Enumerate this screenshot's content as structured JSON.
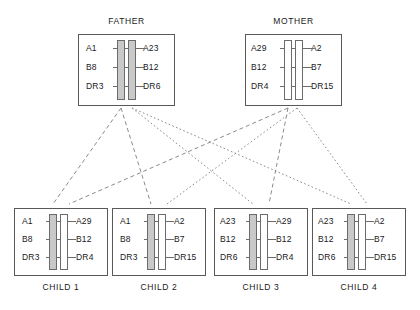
{
  "diagram": {
    "type": "hla-haplotype-inheritance-pedigree",
    "parents": [
      {
        "id": "father",
        "title": "FATHER",
        "haplotypes": [
          {
            "id": "father-haplotype-a",
            "fill": "#c9c9c9",
            "alleles": [
              "A1",
              "B8",
              "DR3"
            ]
          },
          {
            "id": "father-haplotype-b",
            "fill": "#c9c9c9",
            "alleles": [
              "A23",
              "B12",
              "DR6"
            ]
          }
        ]
      },
      {
        "id": "mother",
        "title": "MOTHER",
        "haplotypes": [
          {
            "id": "mother-haplotype-a",
            "fill": "#ffffff",
            "alleles": [
              "A29",
              "B12",
              "DR4"
            ]
          },
          {
            "id": "mother-haplotype-b",
            "fill": "#ffffff",
            "alleles": [
              "A2",
              "B7",
              "DR15"
            ]
          }
        ]
      }
    ],
    "children": [
      {
        "id": "child-1",
        "label": "CHILD 1",
        "paternal": {
          "alleles": [
            "A1",
            "B8",
            "DR3"
          ],
          "from": "father-haplotype-a",
          "fill": "#c9c9c9"
        },
        "maternal": {
          "alleles": [
            "A29",
            "B12",
            "DR4"
          ],
          "from": "mother-haplotype-a",
          "fill": "#ffffff"
        }
      },
      {
        "id": "child-2",
        "label": "CHILD 2",
        "paternal": {
          "alleles": [
            "A1",
            "B8",
            "DR3"
          ],
          "from": "father-haplotype-a",
          "fill": "#c9c9c9"
        },
        "maternal": {
          "alleles": [
            "A2",
            "B7",
            "DR15"
          ],
          "from": "mother-haplotype-b",
          "fill": "#ffffff"
        }
      },
      {
        "id": "child-3",
        "label": "CHILD 3",
        "paternal": {
          "alleles": [
            "A23",
            "B12",
            "DR6"
          ],
          "from": "father-haplotype-b",
          "fill": "#c9c9c9"
        },
        "maternal": {
          "alleles": [
            "A29",
            "B12",
            "DR4"
          ],
          "from": "mother-haplotype-a",
          "fill": "#ffffff"
        }
      },
      {
        "id": "child-4",
        "label": "CHILD 4",
        "paternal": {
          "alleles": [
            "A23",
            "B12",
            "DR6"
          ],
          "from": "father-haplotype-b",
          "fill": "#c9c9c9"
        },
        "maternal": {
          "alleles": [
            "A2",
            "B7",
            "DR15"
          ],
          "from": "mother-haplotype-b",
          "fill": "#ffffff"
        }
      }
    ],
    "inheritance_links": [
      {
        "from": "father-haplotype-a",
        "to": "child-1",
        "style": "dashed"
      },
      {
        "from": "father-haplotype-a",
        "to": "child-2",
        "style": "dashed"
      },
      {
        "from": "father-haplotype-b",
        "to": "child-3",
        "style": "dotted"
      },
      {
        "from": "father-haplotype-b",
        "to": "child-4",
        "style": "dotted"
      },
      {
        "from": "mother-haplotype-a",
        "to": "child-1",
        "style": "dotted"
      },
      {
        "from": "mother-haplotype-a",
        "to": "child-3",
        "style": "dotted"
      },
      {
        "from": "mother-haplotype-b",
        "to": "child-2",
        "style": "dashed"
      },
      {
        "from": "mother-haplotype-b",
        "to": "child-4",
        "style": "dashed"
      }
    ],
    "colors": {
      "paternal_bar": "#c9c9c9",
      "maternal_bar": "#ffffff",
      "box_border": "#595959",
      "bar_border": "#6b6b6b",
      "link_line": "#7d7d7d",
      "text": "#1a1a1a"
    }
  }
}
